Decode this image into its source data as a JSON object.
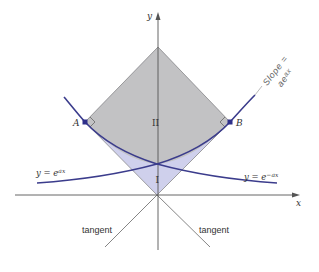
{
  "figure": {
    "axes": {
      "x_label": "x",
      "y_label": "y"
    },
    "regions": [
      {
        "label": "II",
        "fill": "#c2c2c4",
        "description": "gray region above curves inside square"
      },
      {
        "label": "I",
        "fill": "#cfd0ec",
        "description": "lavender region below curves inside square"
      }
    ],
    "points": [
      {
        "label": "A",
        "color": "#2e2f8a"
      },
      {
        "label": "B",
        "color": "#2e2f8a"
      }
    ],
    "curves": [
      {
        "label": "y = e",
        "exponent": "ax",
        "color": "#3b3c8c"
      },
      {
        "label": "y = e",
        "exponent": "−ax",
        "color": "#3b3c8c"
      }
    ],
    "tangent_labels": [
      "tangent",
      "tangent"
    ],
    "annotation": {
      "line1": "Slope =",
      "line2": "ae",
      "line2_exp": "ax"
    },
    "colors": {
      "curve": "#3b3c8c",
      "axis": "#555555",
      "gray_region": "#c2c2c4",
      "lavender_region": "#cfd0ec",
      "outline": "#7a7a7a"
    }
  }
}
